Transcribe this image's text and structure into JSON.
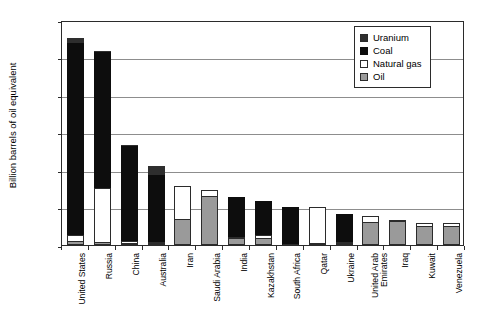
{
  "chart_data": {
    "type": "bar",
    "stacked": true,
    "title": "",
    "xlabel": "",
    "ylabel": "Billion barrels of oil equivalent",
    "ylim": [
      0,
      1200
    ],
    "yticks": [
      0,
      200,
      400,
      600,
      800,
      1000,
      1200
    ],
    "grid": true,
    "legend_position": "top-right",
    "categories": [
      "United States",
      "Russia",
      "China",
      "Australia",
      "Iran",
      "Saudi Arabia",
      "India",
      "Kazakhstan",
      "South Africa",
      "Qatar",
      "Ukraine",
      "United Arab Emirates",
      "Iraq",
      "Kuwait",
      "Venezuela"
    ],
    "series": [
      {
        "name": "Oil",
        "color": "#9a9a9a",
        "values": [
          22,
          15,
          12,
          4,
          138,
          264,
          36,
          40,
          0,
          2,
          2,
          125,
          130,
          104,
          99
        ]
      },
      {
        "name": "Natural gas",
        "color": "#ffffff",
        "values": [
          30,
          290,
          10,
          4,
          178,
          32,
          6,
          12,
          0,
          192,
          6,
          29,
          6,
          11,
          16
        ]
      },
      {
        "name": "Coal",
        "color": "#0d0d0d",
        "values": [
          1028,
          725,
          505,
          360,
          0,
          0,
          215,
          182,
          205,
          0,
          148,
          0,
          0,
          0,
          0
        ]
      },
      {
        "name": "Uranium",
        "color": "#2e2e2e",
        "values": [
          22,
          4,
          2,
          44,
          0,
          0,
          0,
          0,
          0,
          0,
          0,
          0,
          0,
          0,
          0
        ]
      }
    ],
    "totals": [
      1102,
      1034,
      529,
      412,
      316,
      296,
      257,
      234,
      205,
      194,
      156,
      154,
      136,
      115,
      115
    ],
    "legend_entries": [
      "Uranium",
      "Coal",
      "Natural gas",
      "Oil"
    ]
  }
}
